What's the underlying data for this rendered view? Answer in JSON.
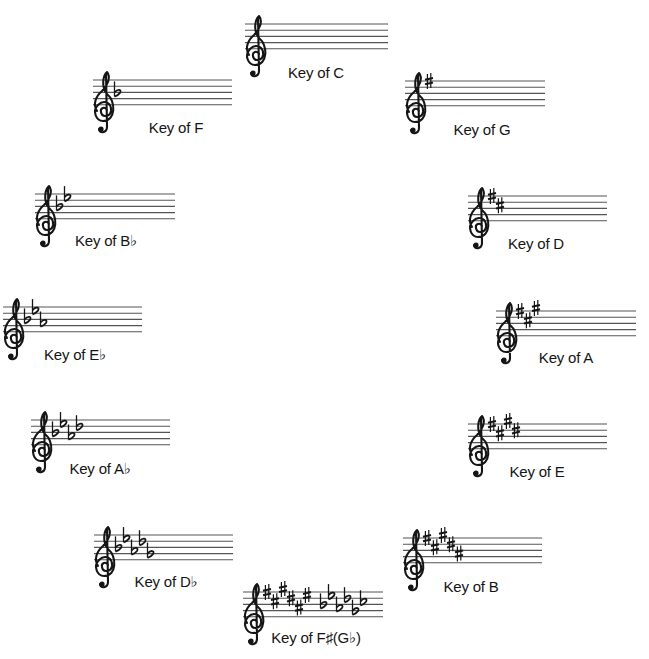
{
  "colors": {
    "ink": "#151515",
    "staff_line": "#555555",
    "background": "#ffffff"
  },
  "keys": [
    {
      "id": "c",
      "label": "Key of C",
      "accidental": "none",
      "count": 0,
      "staff": {
        "x": 245,
        "y": 24,
        "w": 143
      },
      "label_pos": {
        "x": 316,
        "y": 64
      }
    },
    {
      "id": "g",
      "label": "Key of G",
      "accidental": "sharp",
      "count": 1,
      "staff": {
        "x": 405,
        "y": 81,
        "w": 140
      },
      "label_pos": {
        "x": 482,
        "y": 121
      }
    },
    {
      "id": "d",
      "label": "Key of D",
      "accidental": "sharp",
      "count": 2,
      "staff": {
        "x": 468,
        "y": 196,
        "w": 139
      },
      "label_pos": {
        "x": 536,
        "y": 235
      }
    },
    {
      "id": "a",
      "label": "Key of A",
      "accidental": "sharp",
      "count": 3,
      "staff": {
        "x": 496,
        "y": 311,
        "w": 140
      },
      "label_pos": {
        "x": 566,
        "y": 349
      }
    },
    {
      "id": "e",
      "label": "Key of E",
      "accidental": "sharp",
      "count": 4,
      "staff": {
        "x": 468,
        "y": 424,
        "w": 139
      },
      "label_pos": {
        "x": 537,
        "y": 463
      }
    },
    {
      "id": "b",
      "label": "Key of B",
      "accidental": "sharp",
      "count": 5,
      "staff": {
        "x": 403,
        "y": 538,
        "w": 139
      },
      "label_pos": {
        "x": 471,
        "y": 578
      }
    },
    {
      "id": "fs",
      "label": "Key of F♯(G♭)",
      "accidental": "both",
      "count": 6,
      "staff": {
        "x": 243,
        "y": 592,
        "w": 140
      },
      "label_pos": {
        "x": 316,
        "y": 629
      }
    },
    {
      "id": "db",
      "label": "Key of D♭",
      "accidental": "flat",
      "count": 5,
      "staff": {
        "x": 94,
        "y": 535,
        "w": 139
      },
      "label_pos": {
        "x": 166,
        "y": 573
      }
    },
    {
      "id": "ab",
      "label": "Key of A♭",
      "accidental": "flat",
      "count": 4,
      "staff": {
        "x": 31,
        "y": 420,
        "w": 139
      },
      "label_pos": {
        "x": 100,
        "y": 460
      }
    },
    {
      "id": "eb",
      "label": "Key of E♭",
      "accidental": "flat",
      "count": 3,
      "staff": {
        "x": 3,
        "y": 307,
        "w": 139
      },
      "label_pos": {
        "x": 75,
        "y": 346
      }
    },
    {
      "id": "bb",
      "label": "Key of B♭",
      "accidental": "flat",
      "count": 2,
      "staff": {
        "x": 35,
        "y": 194,
        "w": 140
      },
      "label_pos": {
        "x": 106,
        "y": 232
      }
    },
    {
      "id": "f",
      "label": "Key of F",
      "accidental": "flat",
      "count": 1,
      "staff": {
        "x": 93,
        "y": 80,
        "w": 139
      },
      "label_pos": {
        "x": 176,
        "y": 119
      }
    }
  ],
  "sharp_order": [
    "F",
    "C",
    "G",
    "D",
    "A",
    "E"
  ],
  "flat_order": [
    "B",
    "E",
    "A",
    "D",
    "G",
    "C"
  ],
  "icons": {
    "clef": "treble-clef-icon",
    "sharp": "sharp-icon",
    "flat": "flat-icon"
  }
}
